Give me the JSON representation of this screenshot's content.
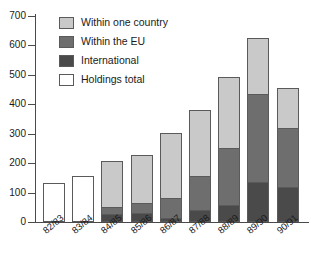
{
  "chart_data": {
    "type": "bar",
    "stacked": true,
    "title": "",
    "subtitle": "",
    "xlabel": "",
    "ylabel": "",
    "ylim": [
      0,
      700
    ],
    "ytick_step": 100,
    "yticks": [
      0,
      100,
      200,
      300,
      400,
      500,
      600,
      700
    ],
    "ytick_labels": [
      "0",
      "100",
      "200",
      "300",
      "400",
      "500",
      "600",
      "700"
    ],
    "grid": false,
    "legend_position": "upper-left-inside",
    "categories": [
      "82/83",
      "83/84",
      "84/85",
      "85/86",
      "86/87",
      "87/88",
      "88/89",
      "89/90",
      "90/91"
    ],
    "series": [
      {
        "name": "Within one country",
        "color": "#c9c9c9",
        "values": [
          null,
          null,
          157,
          163,
          220,
          224,
          242,
          190,
          137
        ]
      },
      {
        "name": "Within the EU",
        "color": "#6e6e6e",
        "values": [
          null,
          null,
          22,
          35,
          68,
          116,
          192,
          300,
          200
        ]
      },
      {
        "name": "International",
        "color": "#4a4a4a",
        "values": [
          null,
          null,
          28,
          30,
          15,
          42,
          58,
          135,
          118
        ]
      },
      {
        "name": "Holdings total",
        "color": "#ffffff",
        "values": [
          133,
          155,
          null,
          null,
          null,
          null,
          null,
          null,
          null
        ]
      }
    ],
    "cumulative_tops": {
      "international": [
        null,
        null,
        28,
        30,
        15,
        42,
        58,
        135,
        118
      ],
      "within_the_eu": [
        null,
        null,
        50,
        65,
        83,
        158,
        250,
        435,
        318
      ],
      "within_one_country": [
        null,
        null,
        207,
        228,
        303,
        382,
        492,
        625,
        455
      ],
      "holdings_total": [
        133,
        155,
        null,
        null,
        null,
        null,
        null,
        null,
        null
      ]
    },
    "totals": [
      133,
      155,
      207,
      228,
      303,
      382,
      492,
      625,
      455
    ]
  },
  "legend": {
    "items": [
      {
        "label": "Within one country"
      },
      {
        "label": "Within the EU"
      },
      {
        "label": "International"
      },
      {
        "label": "Holdings total"
      }
    ]
  }
}
